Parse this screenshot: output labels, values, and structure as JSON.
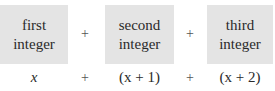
{
  "boxes": [
    {
      "line1": "first",
      "line2": "integer"
    },
    {
      "line1": "second",
      "line2": "integer"
    },
    {
      "line1": "third",
      "line2": "integer"
    }
  ],
  "operators": {
    "top": [
      "+",
      "+"
    ],
    "bottom": [
      "+",
      "+"
    ]
  },
  "expressions": [
    {
      "text": "x"
    },
    {
      "text": "(x + 1)"
    },
    {
      "text": "(x + 2)"
    }
  ],
  "colors": {
    "box_fill": "#e4e4e4",
    "text": "#2a2a2a"
  }
}
